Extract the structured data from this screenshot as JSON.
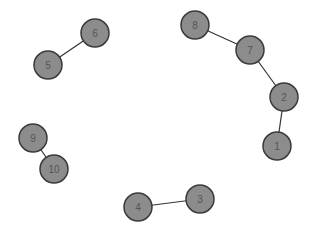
{
  "graph": {
    "node_radius": 14,
    "node_fill": "#8c8c8c",
    "node_stroke": "#3a3a3a",
    "edge_color": "#333333",
    "nodes": [
      {
        "id": "1",
        "label": "1",
        "x": 277,
        "y": 146
      },
      {
        "id": "2",
        "label": "2",
        "x": 284,
        "y": 97
      },
      {
        "id": "3",
        "label": "3",
        "x": 200,
        "y": 199
      },
      {
        "id": "4",
        "label": "4",
        "x": 138,
        "y": 207
      },
      {
        "id": "5",
        "label": "5",
        "x": 48,
        "y": 65
      },
      {
        "id": "6",
        "label": "6",
        "x": 95,
        "y": 33
      },
      {
        "id": "7",
        "label": "7",
        "x": 250,
        "y": 50
      },
      {
        "id": "8",
        "label": "8",
        "x": 195,
        "y": 25
      },
      {
        "id": "9",
        "label": "9",
        "x": 33,
        "y": 138
      },
      {
        "id": "10",
        "label": "10",
        "x": 54,
        "y": 169
      }
    ],
    "edges": [
      {
        "source": "5",
        "target": "6"
      },
      {
        "source": "8",
        "target": "7"
      },
      {
        "source": "7",
        "target": "2"
      },
      {
        "source": "2",
        "target": "1"
      },
      {
        "source": "9",
        "target": "10"
      },
      {
        "source": "4",
        "target": "3"
      }
    ]
  }
}
